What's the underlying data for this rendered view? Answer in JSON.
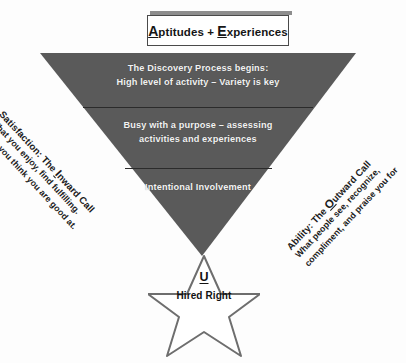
{
  "header": {
    "cap_a": "A",
    "rest_a": "ptitudes",
    "plus": " + ",
    "cap_e": "E",
    "rest_e": "xperiences",
    "full_text": "Aptitudes + Experiences"
  },
  "funnel": {
    "fill_color": "#5a5a5a",
    "divider_color": "#2f2f2f",
    "bands": [
      {
        "id": "discovery",
        "lines": [
          "The Discovery Process begins:",
          "High level of activity – Variety is key"
        ]
      },
      {
        "id": "purpose",
        "lines": [
          "Busy with a purpose – assessing",
          "activities and experiences"
        ]
      },
      {
        "id": "involvement",
        "lines": [
          "Intentional Involvement"
        ]
      }
    ]
  },
  "left_label": {
    "title_pre": "Satisfaction: The ",
    "title_cap": "I",
    "title_post": "nward Call",
    "sub_line_1": "What you enjoy, find fulfilling.",
    "sub_line_2": "What you think you are good at."
  },
  "right_label": {
    "title_pre": "Ability: The ",
    "title_cap": "O",
    "title_post": "utward Call",
    "sub_line_1": "What people see, recognize,",
    "sub_line_2": "compliment, and praise you for"
  },
  "star": {
    "symbol": "U",
    "caption": "Hired Right",
    "outline_color": "#6e6e6e",
    "fill_color": "#ffffff"
  }
}
